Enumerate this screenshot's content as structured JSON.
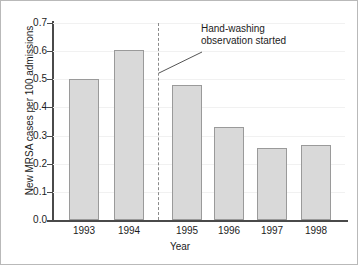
{
  "chart_data": {
    "type": "bar",
    "title": "",
    "xlabel": "Year",
    "ylabel": "New MRSA cases per 100 admissions",
    "categories": [
      "1993",
      "1994",
      "1995",
      "1996",
      "1997",
      "1998"
    ],
    "values": [
      0.5,
      0.605,
      0.48,
      0.33,
      0.255,
      0.265
    ],
    "ylim": [
      0.0,
      0.7
    ],
    "yticks": [
      "0.0",
      "0.1",
      "0.2",
      "0.3",
      "0.4",
      "0.5",
      "0.6",
      "0.7"
    ],
    "ytick_values": [
      0.0,
      0.1,
      0.2,
      0.3,
      0.4,
      0.5,
      0.6,
      0.7
    ],
    "grid": true,
    "legend": "none",
    "bar_color": "#d9d9d9",
    "bar_border_color": "#9a9a9a",
    "axis_color": "#4a4a4a",
    "annotations": [
      {
        "text_line1": "Hand-washing",
        "text_line2": "observation started",
        "marker": "dashed-vertical-line",
        "marker_color": "#8a8a8a",
        "between_categories": [
          "1994",
          "1995"
        ]
      }
    ]
  }
}
